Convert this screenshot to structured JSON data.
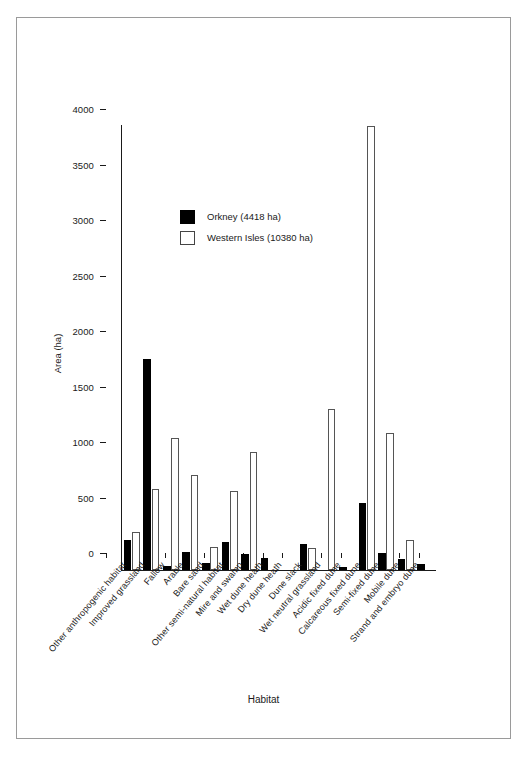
{
  "axes": {
    "ylabel": "Area (ha)",
    "xlabel": "Habitat",
    "yticks": [
      "0",
      "500",
      "1000",
      "1500",
      "2000",
      "2500",
      "3000",
      "3500",
      "4000"
    ]
  },
  "legend": {
    "items": [
      {
        "label": "Orkney (4418 ha)",
        "swatch": "black"
      },
      {
        "label": "Western Isles (10380 ha)",
        "swatch": "white"
      }
    ]
  },
  "chart_data": {
    "type": "bar",
    "title": "",
    "xlabel": "Habitat",
    "ylabel": "Area (ha)",
    "ylim": [
      0,
      4000
    ],
    "ytick_step": 500,
    "grid": false,
    "legend_position": "upper-left-inside",
    "categories": [
      "Other anthropogenic habitat",
      "Improved grassland",
      "Fallow",
      "Arable",
      "Bare sand",
      "Other semi-natural habitat",
      "Mire and swamp",
      "Wet dune heath",
      "Dry dune heath",
      "Dune slack",
      "Wet neutral grassland",
      "Acidic fixed dune",
      "Calcareous fixed dune",
      "Semi-fixed dune",
      "Mobile dune",
      "Strand and embryo dune"
    ],
    "series": [
      {
        "name": "Orkney (4418 ha)",
        "color": "#000000",
        "values": [
          270,
          1900,
          40,
          160,
          65,
          250,
          140,
          105,
          0,
          235,
          0,
          30,
          600,
          150,
          95,
          55
        ]
      },
      {
        "name": "Western Isles (10380 ha)",
        "color": "#ffffff",
        "values": [
          340,
          730,
          1185,
          855,
          205,
          715,
          1065,
          0,
          0,
          195,
          1455,
          0,
          4000,
          1235,
          270,
          0
        ]
      }
    ]
  }
}
